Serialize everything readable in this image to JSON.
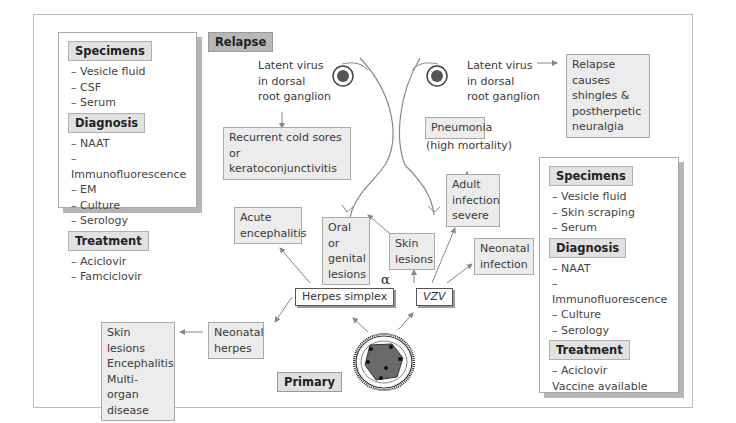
{
  "diagram": {
    "tags": {
      "relapse": "Relapse",
      "primary": "Primary"
    },
    "left_panel": {
      "specimens": {
        "title": "Specimens",
        "items": [
          "– Vesicle fluid",
          "– CSF",
          "– Serum"
        ]
      },
      "diagnosis": {
        "title": "Diagnosis",
        "items": [
          "– NAAT",
          "– Immunofluorescence",
          "– EM",
          "– Culture",
          "– Serology"
        ]
      },
      "treatment": {
        "title": "Treatment",
        "items": [
          "– Aciclovir",
          "– Famciclovir"
        ]
      }
    },
    "right_panel": {
      "specimens": {
        "title": "Specimens",
        "items": [
          "– Vesicle fluid",
          "– Skin scraping",
          "– Serum"
        ]
      },
      "diagnosis": {
        "title": "Diagnosis",
        "items": [
          "– NAAT",
          "– Immunofluorescence",
          "– Culture",
          "– Serology"
        ]
      },
      "treatment": {
        "title": "Treatment",
        "items": [
          "– Aciclovir",
          "Vaccine available"
        ]
      }
    },
    "latent_hsv": [
      "Latent virus",
      "in dorsal",
      "root ganglion"
    ],
    "latent_vzv": [
      "Latent virus",
      "in dorsal",
      "root ganglion"
    ],
    "recurrent": [
      "Recurrent cold sores",
      "or keratoconjunctivitis"
    ],
    "relapse_causes": [
      "Relapse causes",
      "shingles &",
      "postherpetic",
      "neuralgia"
    ],
    "pneumonia": "Pneumonia",
    "high_mortality": "(high mortality)",
    "adult_infection": [
      "Adult",
      "infection",
      "severe"
    ],
    "acute_encephalitis": [
      "Acute",
      "encephalitis"
    ],
    "oral_genital": [
      "Oral or",
      "genital",
      "lesions"
    ],
    "skin_lesions": [
      "Skin",
      "lesions"
    ],
    "neonatal_infection": [
      "Neonatal",
      "infection"
    ],
    "herpes_simplex": "Herpes simplex",
    "vzv": "VZV",
    "alpha": "α",
    "neonatal_herpes": [
      "Neonatal",
      "herpes"
    ],
    "neonatal_outcomes": [
      "Skin lesions",
      "Encephalitis",
      "Multi-organ",
      "disease"
    ]
  }
}
